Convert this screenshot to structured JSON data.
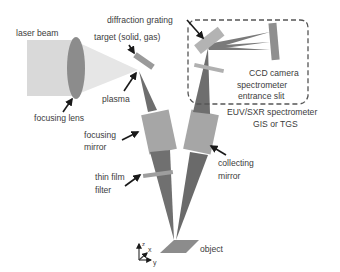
{
  "diagram": {
    "type": "experimental-setup-schematic",
    "colors": {
      "laser_beam": "#d9d9d9",
      "lens": "#8c8c8c",
      "cone": "#e6e6e6",
      "beam_dark": "#6e6e6e",
      "mirror": "#a6a6a6",
      "grating": "#b3b3b3",
      "ccd": "#8f8f8f",
      "object": "#8c8c8c",
      "dashed_box": "#555555",
      "arrow": "#1a1a1a",
      "text": "#3c3c3c"
    },
    "labels": {
      "laser_beam": "laser beam",
      "focusing_lens": "focusing lens",
      "target": "target (solid, gas)",
      "plasma": "plasma",
      "diffraction_grating": "diffraction grating",
      "ccd_camera": "CCD camera",
      "spectrometer_entrance_slit_1": "spectrometer",
      "spectrometer_entrance_slit_2": "entrance slit",
      "spectrometer_1": "EUV/SXR spectrometer",
      "spectrometer_2": "GIS or TGS",
      "focusing_mirror_1": "focusing",
      "focusing_mirror_2": "mirror",
      "collecting_mirror_1": "collecting",
      "collecting_mirror_2": "mirror",
      "thin_film_filter_1": "thin film",
      "thin_film_filter_2": "filter",
      "object": "object",
      "axis_z": "z",
      "axis_x": "x",
      "axis_y": "y"
    }
  }
}
